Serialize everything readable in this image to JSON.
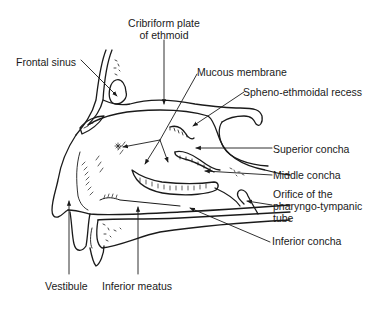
{
  "diagram": {
    "labels": {
      "cribriform_line1": "Cribriform plate",
      "cribriform_line2": "of ethmoid",
      "frontal_sinus": "Frontal sinus",
      "mucous_membrane": "Mucous membrane",
      "spheno_ethmoidal": "Spheno-ethmoidal recess",
      "superior_concha": "Superior concha",
      "middle_concha": "Middle concha",
      "orifice_line1": "Orifice of the",
      "orifice_line2": "pharyngo-tympanic",
      "orifice_line3": "tube",
      "inferior_concha": "Inferior concha",
      "vestibule": "Vestibule",
      "inferior_meatus": "Inferior meatus"
    },
    "colors": {
      "line": "#1a1a1a",
      "background": "#ffffff"
    }
  }
}
